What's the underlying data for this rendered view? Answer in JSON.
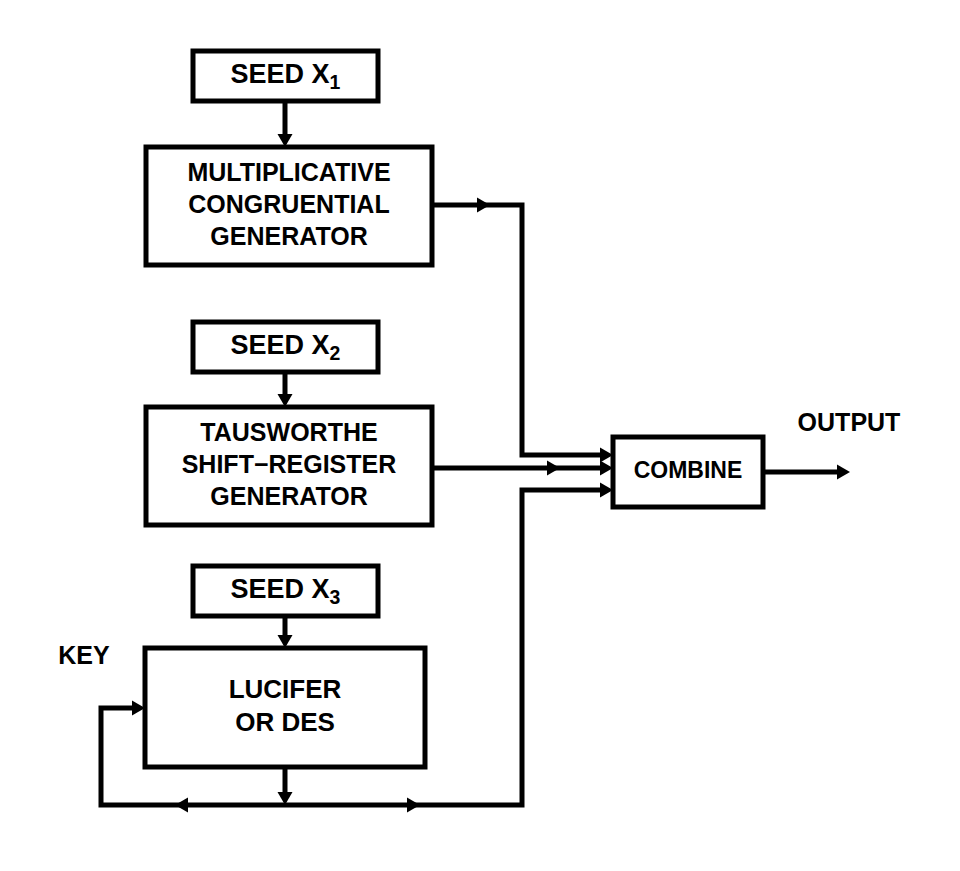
{
  "diagram": {
    "stroke_color": "#000000",
    "background_color": "#ffffff",
    "boxes": [
      {
        "id": "seed-x1",
        "name": "seed-x1-box",
        "lines": [
          "SEED X"
        ],
        "subscript": "1",
        "x": 193,
        "y": 51,
        "w": 185,
        "h": 50,
        "font_size": 27,
        "stroke_width": 5
      },
      {
        "id": "multiplicative-congruential-generator",
        "name": "multiplicative-congruential-generator-box",
        "lines": [
          "MULTIPLICATIVE",
          "CONGRUENTIAL",
          "GENERATOR"
        ],
        "subscript": "",
        "x": 146,
        "y": 147,
        "w": 286,
        "h": 118,
        "font_size": 25,
        "stroke_width": 5
      },
      {
        "id": "seed-x2",
        "name": "seed-x2-box",
        "lines": [
          "SEED X"
        ],
        "subscript": "2",
        "x": 193,
        "y": 322,
        "w": 185,
        "h": 50,
        "font_size": 27,
        "stroke_width": 5
      },
      {
        "id": "tausworthe-shift-register-generator",
        "name": "tausworthe-shift-register-generator-box",
        "lines": [
          "TAUSWORTHE",
          "SHIFT−REGISTER",
          "GENERATOR"
        ],
        "subscript": "",
        "x": 146,
        "y": 407,
        "w": 286,
        "h": 118,
        "font_size": 25,
        "stroke_width": 5
      },
      {
        "id": "seed-x3",
        "name": "seed-x3-box",
        "lines": [
          "SEED X"
        ],
        "subscript": "3",
        "x": 193,
        "y": 566,
        "w": 185,
        "h": 50,
        "font_size": 27,
        "stroke_width": 5
      },
      {
        "id": "lucifer-or-des",
        "name": "lucifer-or-des-box",
        "lines": [
          "LUCIFER",
          "OR DES"
        ],
        "subscript": "",
        "x": 145,
        "y": 648,
        "w": 280,
        "h": 119,
        "font_size": 26,
        "stroke_width": 5
      },
      {
        "id": "combine",
        "name": "combine-box",
        "lines": [
          "COMBINE"
        ],
        "subscript": "",
        "x": 613,
        "y": 437,
        "w": 150,
        "h": 70,
        "font_size": 23,
        "stroke_width": 5
      }
    ],
    "free_labels": [
      {
        "id": "key",
        "name": "key-label",
        "text": "KEY",
        "x": 84,
        "y": 657,
        "font_size": 25
      },
      {
        "id": "output",
        "name": "output-label",
        "text": "OUTPUT",
        "x": 849,
        "y": 424,
        "font_size": 25
      }
    ],
    "connections": [
      {
        "id": "seed1-to-mcg",
        "name": "connector-seed-x1-to-generator",
        "points": "285,101 285,140",
        "width": 5,
        "arrow": {
          "x": 285,
          "y": 147,
          "dir": "down"
        }
      },
      {
        "id": "seed2-to-tausworthe",
        "name": "connector-seed-x2-to-generator",
        "points": "285,372 285,400",
        "width": 5,
        "arrow": {
          "x": 285,
          "y": 407,
          "dir": "down"
        }
      },
      {
        "id": "seed3-to-lucifer",
        "name": "connector-seed-x3-to-lucifer",
        "points": "285,616 285,641",
        "width": 5,
        "arrow": {
          "x": 285,
          "y": 648,
          "dir": "down"
        }
      },
      {
        "id": "mcg-to-combine",
        "name": "connector-generator-to-combine",
        "points": "432,205 522,205 522,455 606,455",
        "width": 5,
        "arrow": {
          "x": 613,
          "y": 455,
          "dir": "right"
        },
        "mid_arrow": {
          "x": 490,
          "y": 205,
          "dir": "right"
        }
      },
      {
        "id": "tausworthe-to-combine",
        "name": "connector-tausworthe-to-combine",
        "points": "432,468 606,468",
        "width": 5,
        "arrow": {
          "x": 613,
          "y": 468,
          "dir": "right"
        },
        "mid_arrow": {
          "x": 560,
          "y": 468,
          "dir": "right"
        }
      },
      {
        "id": "lucifer-out-bus",
        "name": "connector-lucifer-output-bus",
        "points": "285,767 285,798",
        "width": 5,
        "arrow": {
          "x": 285,
          "y": 805,
          "dir": "down"
        }
      },
      {
        "id": "bus-left-to-key",
        "name": "connector-feedback-to-key-input",
        "points": "285,805 101,805 101,708 138,708",
        "width": 5,
        "arrow": {
          "x": 145,
          "y": 708,
          "dir": "right"
        },
        "mid_arrow": {
          "x": 175,
          "y": 805,
          "dir": "left"
        }
      },
      {
        "id": "bus-right-to-combine",
        "name": "connector-feedback-to-combine",
        "points": "285,805 522,805 522,490 606,490",
        "width": 5,
        "arrow": {
          "x": 613,
          "y": 490,
          "dir": "right"
        },
        "mid_arrow": {
          "x": 420,
          "y": 805,
          "dir": "right"
        }
      },
      {
        "id": "combine-to-output",
        "name": "connector-combine-to-output",
        "points": "763,472 838,472",
        "width": 5,
        "arrow": {
          "x": 850,
          "y": 472,
          "dir": "right"
        }
      }
    ]
  }
}
